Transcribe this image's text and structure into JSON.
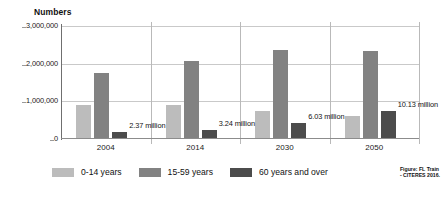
{
  "chart_data": {
    "type": "bar",
    "title": "",
    "ylabel": "Numbers",
    "xlabel": "",
    "categories": [
      "2004",
      "2014",
      "2030",
      "2050"
    ],
    "series": [
      {
        "name": "0-14 years",
        "color": "#bcbcbc",
        "values": [
          900000,
          900000,
          750000,
          600000
        ]
      },
      {
        "name": "15-59 years",
        "color": "#828282",
        "values": [
          1750000,
          2080000,
          2350000,
          2330000
        ]
      },
      {
        "name": "60 years and over",
        "color": "#4c4c4c",
        "values": [
          190000,
          230000,
          430000,
          750000
        ]
      }
    ],
    "ylim": [
      0,
      3000000
    ],
    "yticks": [
      "0",
      "1,000,000",
      "2,000,000",
      "3,000,000"
    ],
    "ytick_values": [
      0,
      1000000,
      2000000,
      3000000
    ],
    "grid": true,
    "legend_position": "bottom",
    "annotations": [
      {
        "text": "2.37 million",
        "category": "2004"
      },
      {
        "text": "3.24 million",
        "category": "2014"
      },
      {
        "text": "6.03 million",
        "category": "2030"
      },
      {
        "text": "10.13 million",
        "category": "2050"
      }
    ]
  },
  "credit": {
    "line1": "Figure: FL Train",
    "line2": "- CITERES 2016."
  }
}
